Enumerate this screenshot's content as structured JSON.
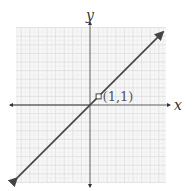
{
  "chart_data": {
    "type": "line",
    "title": "",
    "xlabel": "x",
    "ylabel": "y",
    "xlim": [
      -9,
      9
    ],
    "ylim": [
      -9,
      9
    ],
    "grid": true,
    "series": [
      {
        "name": "y = x",
        "x": [
          -8.5,
          8.5
        ],
        "values": [
          -8.5,
          8.5
        ],
        "arrows_both_ends": true
      }
    ],
    "annotations": [
      {
        "x": 1,
        "y": 1,
        "text": "(1,1)",
        "marker": "open-square"
      }
    ]
  },
  "labels": {
    "x_axis": "x",
    "y_axis": "y",
    "point": "(1,1)"
  },
  "colors": {
    "line": "#444444",
    "axis": "#555555",
    "grid": "#dddddd",
    "grid_minor": "#eeeeee"
  }
}
